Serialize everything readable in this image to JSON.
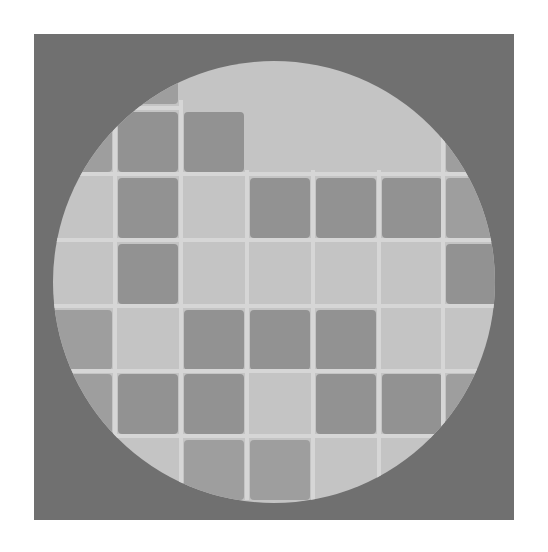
{
  "image": {
    "description": "Gray square frame containing a light circular disc with a grid of darker rounded squares",
    "colors": {
      "background": "#ffffff",
      "frame": "#707070",
      "disc": "#c4c4c4",
      "grid_line": "#d6d6d6",
      "cell_dark": "#929292",
      "cell_partial": "#9e9e9e"
    },
    "frame": {
      "x": 34,
      "y": 34,
      "width": 480,
      "height": 486
    },
    "disc": {
      "cx": 274,
      "cy": 282,
      "r": 221
    },
    "grid": {
      "col_x": [
        52,
        118,
        184,
        250,
        316,
        382,
        446
      ],
      "row_y": [
        44,
        112,
        178,
        244,
        310,
        374,
        440
      ],
      "cell_w": 60,
      "cell_h": 60
    },
    "cells": [
      {
        "row": 0,
        "col": 1,
        "tone": "cell_partial"
      },
      {
        "row": 1,
        "col": 0,
        "tone": "cell_partial"
      },
      {
        "row": 1,
        "col": 1,
        "tone": "cell_dark"
      },
      {
        "row": 1,
        "col": 2,
        "tone": "cell_dark"
      },
      {
        "row": 1,
        "col": 6,
        "tone": "cell_partial"
      },
      {
        "row": 2,
        "col": 1,
        "tone": "cell_dark"
      },
      {
        "row": 2,
        "col": 3,
        "tone": "cell_dark"
      },
      {
        "row": 2,
        "col": 4,
        "tone": "cell_dark"
      },
      {
        "row": 2,
        "col": 5,
        "tone": "cell_dark"
      },
      {
        "row": 2,
        "col": 6,
        "tone": "cell_partial"
      },
      {
        "row": 3,
        "col": 1,
        "tone": "cell_dark"
      },
      {
        "row": 3,
        "col": 6,
        "tone": "cell_dark"
      },
      {
        "row": 4,
        "col": 0,
        "tone": "cell_partial"
      },
      {
        "row": 4,
        "col": 2,
        "tone": "cell_dark"
      },
      {
        "row": 4,
        "col": 3,
        "tone": "cell_dark"
      },
      {
        "row": 4,
        "col": 4,
        "tone": "cell_dark"
      },
      {
        "row": 5,
        "col": 0,
        "tone": "cell_partial"
      },
      {
        "row": 5,
        "col": 1,
        "tone": "cell_dark"
      },
      {
        "row": 5,
        "col": 2,
        "tone": "cell_dark"
      },
      {
        "row": 5,
        "col": 4,
        "tone": "cell_dark"
      },
      {
        "row": 5,
        "col": 5,
        "tone": "cell_dark"
      },
      {
        "row": 5,
        "col": 6,
        "tone": "cell_partial"
      },
      {
        "row": 6,
        "col": 2,
        "tone": "cell_partial"
      },
      {
        "row": 6,
        "col": 3,
        "tone": "cell_partial"
      }
    ],
    "grid_lines": {
      "horizontal": [
        {
          "y": 108,
          "x1": 52,
          "x2": 180
        },
        {
          "y": 174,
          "x1": 52,
          "x2": 510
        },
        {
          "y": 240,
          "x1": 52,
          "x2": 510
        },
        {
          "y": 306,
          "x1": 52,
          "x2": 510
        },
        {
          "y": 371,
          "x1": 52,
          "x2": 510
        },
        {
          "y": 436,
          "x1": 52,
          "x2": 510
        }
      ],
      "vertical": [
        {
          "x": 115,
          "y1": 60,
          "y2": 500
        },
        {
          "x": 181,
          "y1": 100,
          "y2": 500
        },
        {
          "x": 247,
          "y1": 170,
          "y2": 500
        },
        {
          "x": 313,
          "y1": 170,
          "y2": 500
        },
        {
          "x": 379,
          "y1": 170,
          "y2": 500
        },
        {
          "x": 443,
          "y1": 100,
          "y2": 470
        }
      ]
    }
  }
}
